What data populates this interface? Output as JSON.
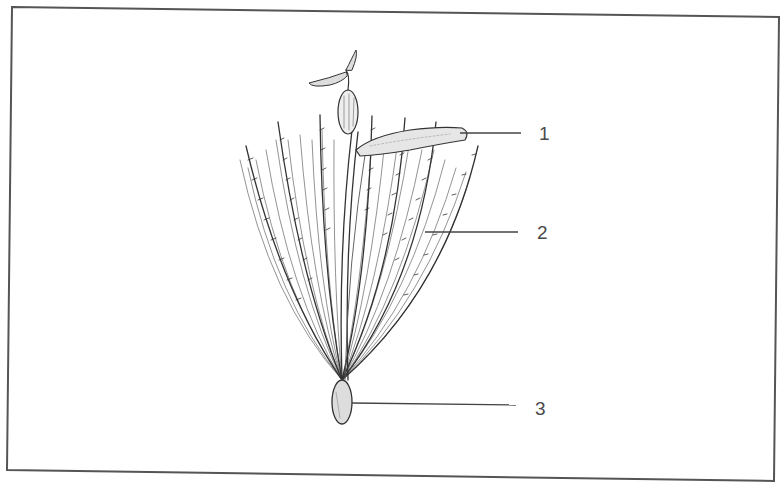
{
  "figure": {
    "frame_color": "#555555",
    "ink_color": "#2f2f2f",
    "callouts": [
      {
        "number": "1",
        "target": "corolla / floret tube"
      },
      {
        "number": "2",
        "target": "pappus bristles"
      },
      {
        "number": "3",
        "target": "seed (achene)"
      }
    ]
  }
}
